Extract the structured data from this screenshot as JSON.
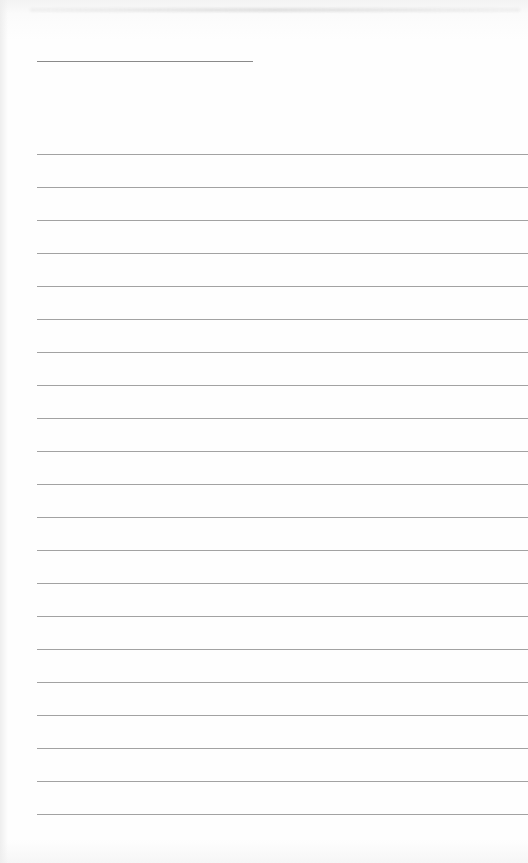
{
  "document": {
    "type": "lined-paper",
    "title_line": {
      "x": 37,
      "y": 61,
      "width": 216
    },
    "rules": {
      "start_y": 154,
      "spacing": 33,
      "count": 21,
      "left": 37
    },
    "colors": {
      "paper": "#fdfdfd",
      "title_line": "#8a8a8a",
      "rule_line": "#a2a2a2"
    },
    "text": []
  }
}
